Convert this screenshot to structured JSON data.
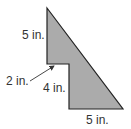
{
  "diagram": {
    "shape": "composite figure (right triangle with rectangular notch removed)",
    "fill_color": "#ababab",
    "stroke_color": "#222222",
    "vertices": [
      [
        47,
        8
      ],
      [
        123,
        109
      ],
      [
        69,
        109
      ],
      [
        69,
        64
      ],
      [
        47,
        64
      ]
    ],
    "labels": {
      "left_side": "5 in.",
      "notch_width": "2 in.",
      "inner_vertical": "4 in.",
      "bottom": "5 in."
    },
    "arrow": {
      "from": [
        30,
        81
      ],
      "to": [
        55,
        66
      ]
    }
  }
}
